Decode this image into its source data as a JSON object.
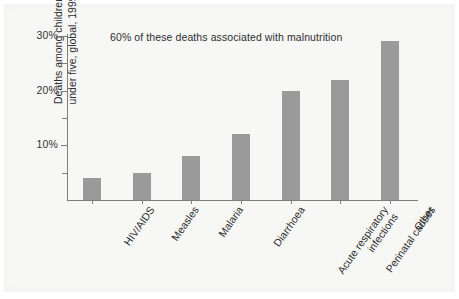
{
  "chart_data": {
    "type": "bar",
    "title": "",
    "annotation": "60% of these deaths associated with malnutrition",
    "xlabel": "",
    "ylabel": "Deaths among children under five, global, 1999",
    "ylabel_lines": [
      "Deaths among children",
      "under five, global, 1999"
    ],
    "categories": [
      "HIV/AIDS",
      "Measles",
      "Malaria",
      "Diarrhoea",
      "Acute respiratory infections",
      "Perinatal causes",
      "Other"
    ],
    "category_lines": [
      [
        "HIV/AIDS"
      ],
      [
        "Measles"
      ],
      [
        "Malaria"
      ],
      [
        "Diarrhoea"
      ],
      [
        "Acute respiratory",
        "infections"
      ],
      [
        "Perinatal causes"
      ],
      [
        "Other"
      ]
    ],
    "values": [
      4,
      5,
      8,
      12,
      20,
      22,
      29
    ],
    "value_unit": "%",
    "ylim": [
      0,
      30
    ],
    "ytick_major": [
      10,
      20,
      30
    ],
    "ytick_major_labels": [
      "10%",
      "20%",
      "30%"
    ],
    "ytick_minor": [
      5,
      15,
      25
    ],
    "grid": false,
    "legend": false,
    "bar_color": "#9a9a9a",
    "axis_color": "#7d7d7d",
    "text_color": "#2e2e2e",
    "background_color": "#f7f7f6"
  }
}
